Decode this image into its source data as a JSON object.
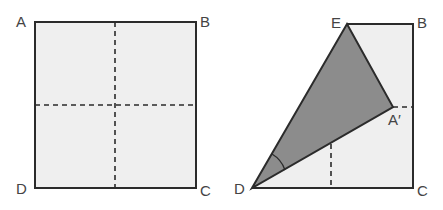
{
  "figure_left": {
    "title": "Square paper ABCD with fold lines",
    "labels": {
      "A": "A",
      "B": "B",
      "C": "C",
      "D": "D"
    }
  },
  "figure_right": {
    "title": "Paper folded along DE so A lands on A'",
    "labels": {
      "E": "E",
      "B": "B",
      "A_prime": "A′",
      "D": "D",
      "C": "C"
    }
  },
  "colors": {
    "paper": "#efefef",
    "folded": "#8c8c8c",
    "line": "#2b2b2b"
  }
}
